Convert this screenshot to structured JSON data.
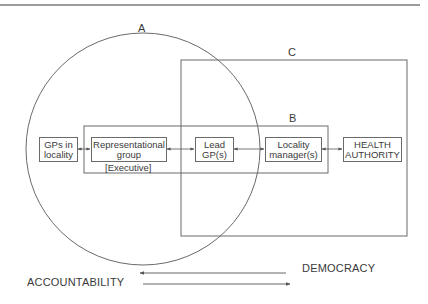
{
  "diagram": {
    "colors": {
      "line": "#6a6a6a",
      "text": "#3a3a3a",
      "background": "#ffffff"
    },
    "regions": {
      "A": {
        "label": "A",
        "shape": "circle"
      },
      "B": {
        "label": "B",
        "shape": "rectangle"
      },
      "C": {
        "label": "C",
        "shape": "rectangle"
      }
    },
    "nodes": [
      {
        "id": "gps",
        "lines": [
          "GPs in",
          "locality"
        ]
      },
      {
        "id": "rep",
        "lines": [
          "Representational",
          "group"
        ],
        "sublabel": "[Executive]"
      },
      {
        "id": "lead",
        "lines": [
          "Lead",
          "GP(s)"
        ]
      },
      {
        "id": "lm",
        "lines": [
          "Locality",
          "manager(s)"
        ]
      },
      {
        "id": "ha",
        "lines": [
          "HEALTH",
          "AUTHORITY"
        ]
      }
    ],
    "edges": [
      {
        "from": "gps",
        "to": "rep",
        "type": "bidirectional"
      },
      {
        "from": "rep",
        "to": "lead",
        "type": "bidirectional"
      },
      {
        "from": "lead",
        "to": "lm",
        "type": "bidirectional"
      },
      {
        "from": "lm",
        "to": "ha",
        "type": "bidirectional"
      }
    ],
    "axes": {
      "democracy": {
        "label": "DEMOCRACY",
        "direction": "left"
      },
      "accountability": {
        "label": "ACCOUNTABILITY",
        "direction": "right"
      }
    }
  }
}
